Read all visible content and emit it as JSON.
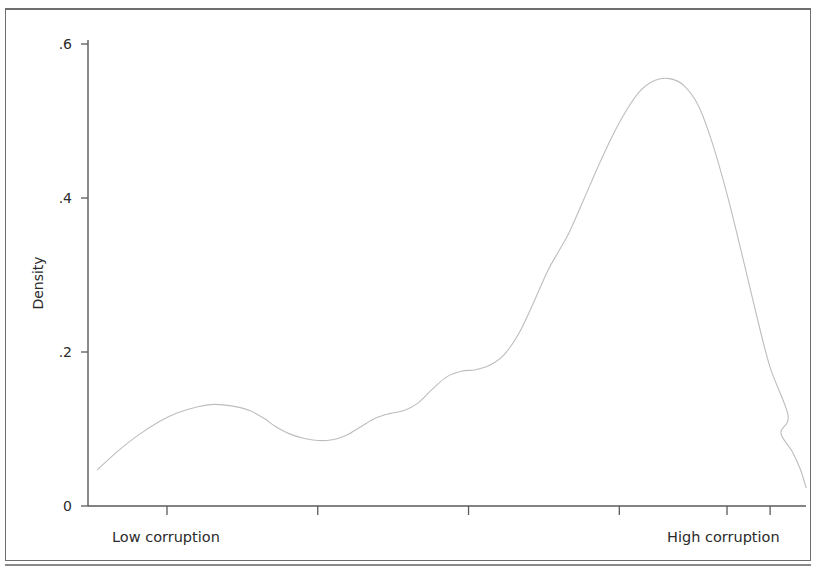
{
  "figure": {
    "background_color": "#ffffff",
    "frame_color": "#6e6e6e"
  },
  "chart_data": {
    "type": "line",
    "title": "",
    "subtitle": "",
    "xlabel": "",
    "ylabel": "Density",
    "curve_label": "Kernel density estimate",
    "line_color": "#bdbdbd",
    "line_width": 1.1,
    "grid": false,
    "legend": false,
    "legend_position": "none",
    "xlim": [
      0,
      100
    ],
    "ylim": [
      0,
      0.6
    ],
    "yticks": [
      0,
      0.2,
      0.4,
      0.6
    ],
    "ytick_labels": [
      "0",
      ".2",
      ".4",
      ".6"
    ],
    "xticks": [
      11,
      32,
      53,
      74,
      89,
      95
    ],
    "xtick_labels": [
      "",
      "",
      "",
      "",
      "",
      ""
    ],
    "x_annotations": [
      {
        "text": "Low corruption",
        "x": 11
      },
      {
        "text": "High corruption",
        "x": 89
      }
    ],
    "x": [
      1.3,
      4.0,
      7.0,
      10.0,
      12.5,
      15.3,
      17.5,
      20.0,
      22.5,
      24.5,
      26.0,
      28.0,
      30.0,
      32.0,
      34.0,
      36.0,
      38.0,
      40.0,
      42.0,
      44.0,
      46.0,
      48.0,
      50.0,
      52.0,
      54.0,
      56.0,
      58.0,
      60.0,
      62.0,
      64.0,
      65.5,
      67.0,
      69.0,
      71.0,
      73.0,
      75.0,
      77.0,
      79.0,
      81.0,
      83.0,
      85.0,
      87.0,
      89.0,
      91.0,
      93.0,
      95.0,
      97.5
    ],
    "y": [
      0.047,
      0.07,
      0.092,
      0.11,
      0.121,
      0.129,
      0.132,
      0.13,
      0.124,
      0.114,
      0.104,
      0.094,
      0.088,
      0.085,
      0.086,
      0.092,
      0.103,
      0.114,
      0.12,
      0.124,
      0.134,
      0.152,
      0.168,
      0.175,
      0.177,
      0.183,
      0.197,
      0.224,
      0.263,
      0.305,
      0.33,
      0.355,
      0.397,
      0.44,
      0.48,
      0.514,
      0.54,
      0.553,
      0.555,
      0.546,
      0.52,
      0.47,
      0.405,
      0.33,
      0.252,
      0.18,
      0.118
    ],
    "y_tail_x": [
      95.0,
      96.5,
      98.0,
      99.2,
      100.0
    ],
    "y_tail_y": [
      0.118,
      0.095,
      0.072,
      0.048,
      0.024
    ]
  },
  "axes": {
    "y_title": "Density",
    "y_tick_labels": [
      "0",
      ".2",
      ".4",
      ".6"
    ],
    "x_label_low": "Low corruption",
    "x_label_high": "High corruption"
  }
}
